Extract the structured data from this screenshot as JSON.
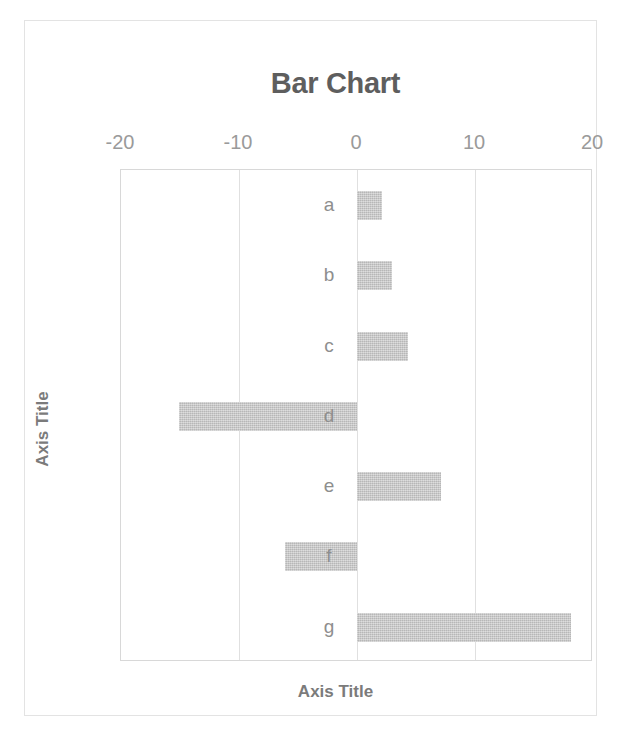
{
  "chart_data": {
    "type": "bar",
    "orientation": "horizontal",
    "title": "Bar Chart",
    "xlabel": "Axis Title",
    "ylabel": "Axis Title",
    "categories": [
      "a",
      "b",
      "c",
      "d",
      "e",
      "f",
      "g"
    ],
    "values": [
      2.1,
      3.0,
      4.3,
      -15.1,
      7.1,
      -6.1,
      18.1
    ],
    "xlim": [
      -20,
      20
    ],
    "xticks": [
      -20,
      -10,
      0,
      10,
      20
    ],
    "xtick_labels": [
      "-20",
      "-10",
      "0",
      "10",
      "20"
    ],
    "grid": true,
    "legend": "none",
    "series": [
      {
        "name": "Series 1",
        "values": [
          2.1,
          3.0,
          4.3,
          -15.1,
          7.1,
          -6.1,
          18.1
        ]
      }
    ]
  },
  "colors": {
    "bar_fill": "#c9c9c9",
    "title_text": "#5e5e5e",
    "tick_text": "#9a9a9a",
    "axis_title_text": "#7b7b7b",
    "category_text": "#8e8e8e",
    "gridline": "#e0e0e0",
    "plot_border": "#d8d8d8",
    "page_border": "#e3e3e3",
    "background": "#ffffff"
  }
}
